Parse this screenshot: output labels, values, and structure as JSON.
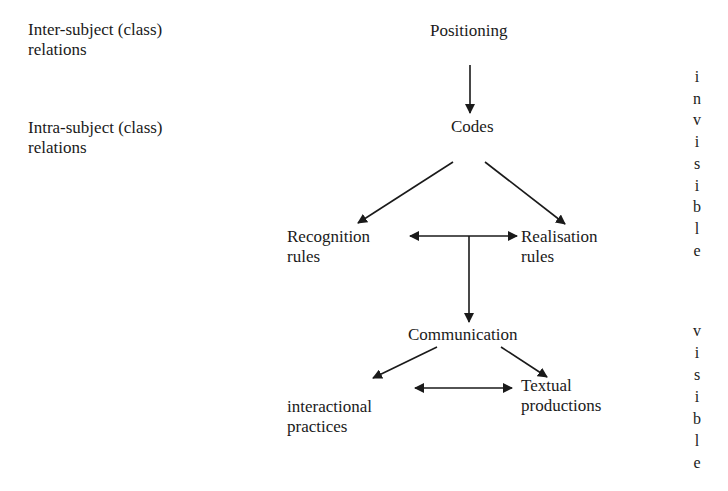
{
  "left_labels": {
    "inter": [
      "Inter-subject (class)",
      "relations"
    ],
    "intra": [
      "Intra-subject (class)",
      "relations"
    ]
  },
  "nodes": {
    "positioning": "Positioning",
    "codes": "Codes",
    "recognition": [
      "Recognition",
      "rules"
    ],
    "realisation": [
      "Realisation",
      "rules"
    ],
    "communication": "Communication",
    "interactional": [
      "interactional",
      "practices"
    ],
    "textual": [
      "Textual",
      "productions"
    ]
  },
  "right_labels": {
    "invisible": [
      "i",
      "n",
      "v",
      "i",
      "s",
      "i",
      "b",
      "l",
      "e"
    ],
    "visible": [
      "v",
      "i",
      "s",
      "i",
      "b",
      "l",
      "e"
    ]
  },
  "edges": [
    {
      "from": "positioning",
      "to": "codes",
      "type": "arrow"
    },
    {
      "from": "codes",
      "to": "recognition",
      "type": "arrow"
    },
    {
      "from": "codes",
      "to": "realisation",
      "type": "arrow"
    },
    {
      "from": "recognition",
      "to": "realisation",
      "type": "double-arrow"
    },
    {
      "from": "recognition-realisation",
      "to": "communication",
      "type": "arrow"
    },
    {
      "from": "communication",
      "to": "interactional",
      "type": "arrow"
    },
    {
      "from": "communication",
      "to": "textual",
      "type": "arrow"
    },
    {
      "from": "interactional",
      "to": "textual",
      "type": "double-arrow"
    }
  ]
}
